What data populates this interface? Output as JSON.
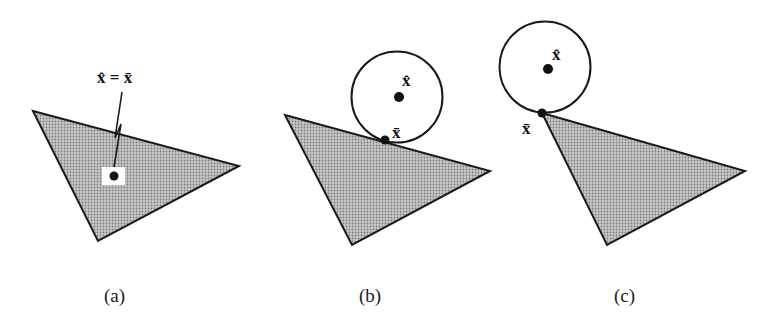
{
  "figure": {
    "panels": [
      {
        "id": "a",
        "caption": "(a)",
        "label": "x̂ = x̄",
        "description": "Point inside triangle: projection equals point"
      },
      {
        "id": "b",
        "caption": "(b)",
        "label_hat": "x̂",
        "label_bar": "x̄",
        "description": "Point outside triangle, projection on edge"
      },
      {
        "id": "c",
        "caption": "(c)",
        "label_hat": "x̂",
        "label_bar": "x̄",
        "description": "Point outside triangle, projection at vertex"
      }
    ],
    "colors": {
      "fill": "#b8b8b8",
      "stroke": "#1a1a1a",
      "background": "#ffffff"
    }
  }
}
